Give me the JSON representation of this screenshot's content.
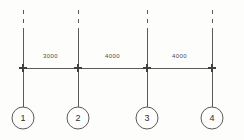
{
  "drawing": {
    "title": "Structural Grid Line Elevation",
    "background_color": "#fdfdfc",
    "line_color": "#5a5a5a",
    "text_color": "#4a4a4a",
    "canvas": {
      "width": 244,
      "height": 140
    },
    "gridlines": [
      {
        "id": "A",
        "x": 23,
        "dash_top_y": 10,
        "solid_start_y": 30,
        "bottom_y": 107
      },
      {
        "id": "B",
        "x": 78,
        "dash_top_y": 10,
        "solid_start_y": 30,
        "bottom_y": 107
      },
      {
        "id": "C",
        "x": 147,
        "dash_top_y": 10,
        "solid_start_y": 30,
        "bottom_y": 107
      },
      {
        "id": "D",
        "x": 212,
        "dash_top_y": 10,
        "solid_start_y": 30,
        "bottom_y": 107
      }
    ],
    "dimension_line": {
      "y": 68,
      "x_start": 23,
      "x_end": 212,
      "tick_style": "cross",
      "tick_half_size": 4,
      "ticks": [
        23,
        78,
        147,
        212
      ]
    },
    "dimensions": [
      {
        "label": "3000",
        "from_x": 23,
        "to_x": 78,
        "center_x": 50.5,
        "text_y": 58
      },
      {
        "label": "4000",
        "from_x": 78,
        "to_x": 147,
        "center_x": 112.5,
        "text_y": 58
      },
      {
        "label": "4000",
        "from_x": 147,
        "to_x": 212,
        "center_x": 179.5,
        "text_y": 58
      }
    ],
    "bubbles": [
      {
        "label": "1",
        "cx": 23,
        "cy": 118,
        "r": 11
      },
      {
        "label": "2",
        "cx": 78,
        "cy": 118,
        "r": 11
      },
      {
        "label": "3",
        "cx": 147,
        "cy": 118,
        "r": 11
      },
      {
        "label": "4",
        "cx": 212,
        "cy": 118,
        "r": 11
      }
    ]
  }
}
